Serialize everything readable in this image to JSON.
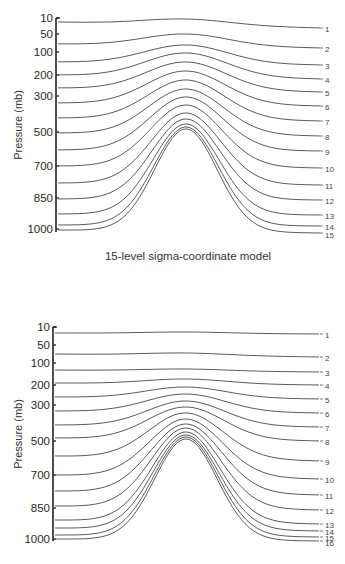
{
  "chart_data": [
    {
      "type": "line",
      "title": "15-level sigma-coordinate model",
      "ylabel": "Pressure (mb)",
      "yticks": [
        "10",
        "50",
        "100",
        "200",
        "300",
        "500",
        "700",
        "850",
        "1000"
      ],
      "y_inverted": true,
      "num_levels": 15,
      "level_labels": [
        "1",
        "2",
        "3",
        "4",
        "5",
        "6",
        "7",
        "8",
        "9",
        "10",
        "11",
        "12",
        "13",
        "14",
        "15"
      ],
      "description": "Sigma-coordinate surfaces following terrain over a bell-shaped mountain; deformation increases toward the surface",
      "geometry": {
        "axis_x": 56,
        "axis_top": 18,
        "axis_bottom": 232,
        "ticks_y": [
          18,
          34,
          52,
          75,
          96,
          132,
          166,
          198,
          229
        ],
        "x_start": 58,
        "x_end": 320,
        "peak_x": 186,
        "label_x": 325,
        "left_y": [
          22,
          44,
          62,
          75,
          88,
          103,
          118,
          133,
          150,
          166,
          183,
          199,
          214,
          225,
          230
        ],
        "right_y": [
          28,
          48,
          65,
          79,
          92,
          106,
          121,
          136,
          151,
          168,
          185,
          200,
          215,
          226,
          233
        ],
        "peak_y": [
          19,
          34,
          45,
          53,
          62,
          71,
          80,
          89,
          97,
          105,
          113,
          119,
          124,
          127,
          129
        ],
        "label_y": [
          29,
          49,
          66,
          80,
          93,
          107,
          122,
          137,
          152,
          169,
          186,
          201,
          216,
          227,
          235
        ]
      }
    },
    {
      "type": "line",
      "title": "",
      "ylabel": "Pressure (mb)",
      "yticks": [
        "10",
        "50",
        "100",
        "200",
        "300",
        "500",
        "700",
        "850",
        "1000"
      ],
      "y_inverted": true,
      "num_levels": 16,
      "level_labels": [
        "1",
        "2",
        "3",
        "4",
        "5",
        "6",
        "7",
        "8",
        "9",
        "10",
        "11",
        "12",
        "13",
        "14",
        "15",
        "16"
      ],
      "description": "16-level hybrid coordinate: upper levels flat (pressure), lower levels terrain-following",
      "geometry": {
        "axis_x": 53,
        "axis_top": 327,
        "axis_bottom": 541,
        "ticks_y": [
          327,
          345,
          363,
          385,
          405,
          441,
          475,
          508,
          539
        ],
        "x_start": 55,
        "x_end": 320,
        "peak_x": 186,
        "label_x": 325,
        "left_y": [
          333,
          354,
          370,
          383,
          397,
          411,
          425,
          438,
          456,
          475,
          491,
          506,
          520,
          528,
          535,
          539
        ],
        "right_y": [
          334,
          357,
          372,
          385,
          399,
          413,
          427,
          441,
          461,
          479,
          495,
          510,
          524,
          531,
          537,
          541
        ],
        "peak_y": [
          332,
          353,
          369,
          379,
          387,
          394,
          401,
          407,
          413,
          419,
          424,
          428,
          432,
          435,
          437,
          439
        ],
        "label_y": [
          335,
          358,
          373,
          386,
          400,
          414,
          428,
          442,
          462,
          480,
          496,
          511,
          525,
          532,
          538,
          543
        ]
      }
    }
  ],
  "panels": {
    "top": {
      "ylabel": "Pressure (mb)",
      "caption": "15-level sigma-coordinate model"
    },
    "bottom": {
      "ylabel": "Pressure (mb)"
    }
  }
}
